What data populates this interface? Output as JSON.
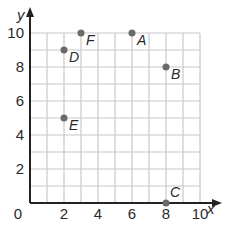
{
  "chart_data": {
    "type": "scatter",
    "title": "",
    "xlabel": "x",
    "ylabel": "y",
    "xlim": [
      0,
      10
    ],
    "ylim": [
      0,
      10
    ],
    "grid": true,
    "grid_step": 1,
    "x_ticks": [
      2,
      4,
      6,
      8,
      10
    ],
    "y_ticks": [
      2,
      4,
      6,
      8,
      10
    ],
    "origin_label": "0",
    "points": [
      {
        "label": "A",
        "x": 6,
        "y": 10
      },
      {
        "label": "B",
        "x": 8,
        "y": 8
      },
      {
        "label": "C",
        "x": 8,
        "y": 0
      },
      {
        "label": "D",
        "x": 2,
        "y": 9
      },
      {
        "label": "E",
        "x": 2,
        "y": 5
      },
      {
        "label": "F",
        "x": 3,
        "y": 10
      }
    ],
    "colors": {
      "grid": "#c8c8c8",
      "axis": "#222222",
      "point": "#6a6a6a",
      "text": "#2a2a2a"
    }
  }
}
